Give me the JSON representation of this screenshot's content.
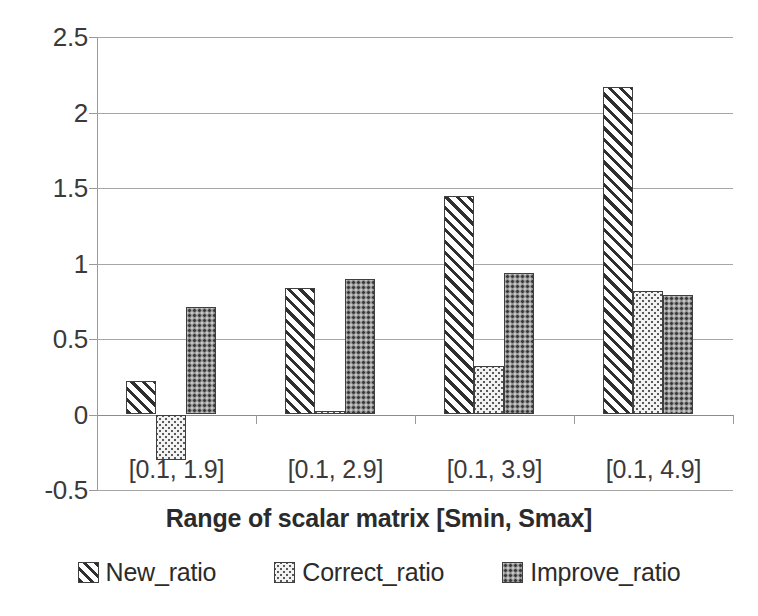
{
  "chart_data": {
    "type": "bar",
    "title": "",
    "subtitle": "",
    "xlabel": "Range of scalar matrix [Smin, Smax]",
    "ylabel": "",
    "categories": [
      "[0.1, 1.9]",
      "[0.1, 2.9]",
      "[0.1, 3.9]",
      "[0.1, 4.9]"
    ],
    "series": [
      {
        "name": "New_ratio",
        "values": [
          0.22,
          0.84,
          1.45,
          2.17
        ]
      },
      {
        "name": "Correct_ratio",
        "values": [
          -0.3,
          0.02,
          0.32,
          0.82
        ]
      },
      {
        "name": "Improve_ratio",
        "values": [
          0.71,
          0.9,
          0.94,
          0.79
        ]
      }
    ],
    "ylim": [
      -0.5,
      2.5
    ],
    "yticks": [
      2.5,
      2,
      1.5,
      1,
      0.5,
      0,
      -0.5
    ],
    "ytick_labels": [
      "2.5",
      "2",
      "1.5",
      "1",
      "0.5",
      "0",
      "-0.5"
    ],
    "grid": true,
    "grid_axis": "y",
    "legend_position": "bottom",
    "bar_patterns": [
      "diagonal-hatch",
      "light-dotted",
      "dark-checker"
    ],
    "colors": {
      "new_ratio": "#ffffff",
      "correct_ratio": "#f2f2f2",
      "improve_ratio": "#8e8e8e",
      "bar_outline": "#3f3f3f",
      "gridline": "#a6a6a6",
      "axis": "#9a9a9a",
      "text": "#2b2b2b",
      "background": "#ffffff"
    }
  },
  "legend": {
    "items": [
      {
        "label": "New_ratio"
      },
      {
        "label": "Correct_ratio"
      },
      {
        "label": "Improve_ratio"
      }
    ]
  }
}
